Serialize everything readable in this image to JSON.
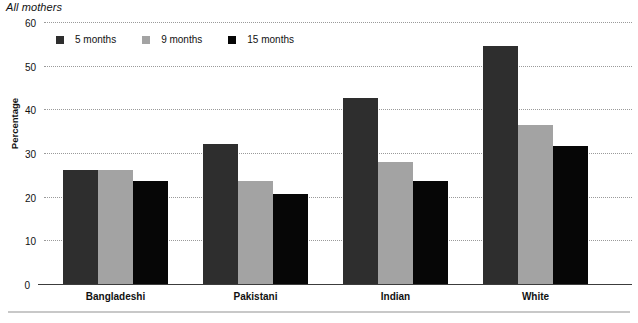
{
  "chart_data": {
    "type": "bar",
    "title": "All mothers",
    "xlabel": "",
    "ylabel": "Percentage",
    "ylim": [
      0,
      60
    ],
    "yticks": [
      0,
      10,
      20,
      30,
      40,
      50,
      60
    ],
    "grid": true,
    "legend_position": "top-left",
    "categories": [
      "Bangladeshi",
      "Pakistani",
      "Indian",
      "White"
    ],
    "series": [
      {
        "name": "5 months",
        "color": "#2e2e2e",
        "values": [
          26.2,
          32.0,
          42.5,
          54.5
        ]
      },
      {
        "name": "9 months",
        "color": "#a3a3a3",
        "values": [
          26.2,
          23.7,
          28.0,
          36.5
        ]
      },
      {
        "name": "15 months",
        "color": "#060606",
        "values": [
          23.6,
          20.5,
          23.5,
          31.6
        ]
      }
    ]
  },
  "axis": {
    "y_label": "Percentage",
    "ticks": [
      "60",
      "50",
      "40",
      "30",
      "20",
      "10",
      "0"
    ]
  },
  "legend": {
    "items": [
      {
        "label": "5 months"
      },
      {
        "label": "9 months"
      },
      {
        "label": "15 months"
      }
    ]
  }
}
